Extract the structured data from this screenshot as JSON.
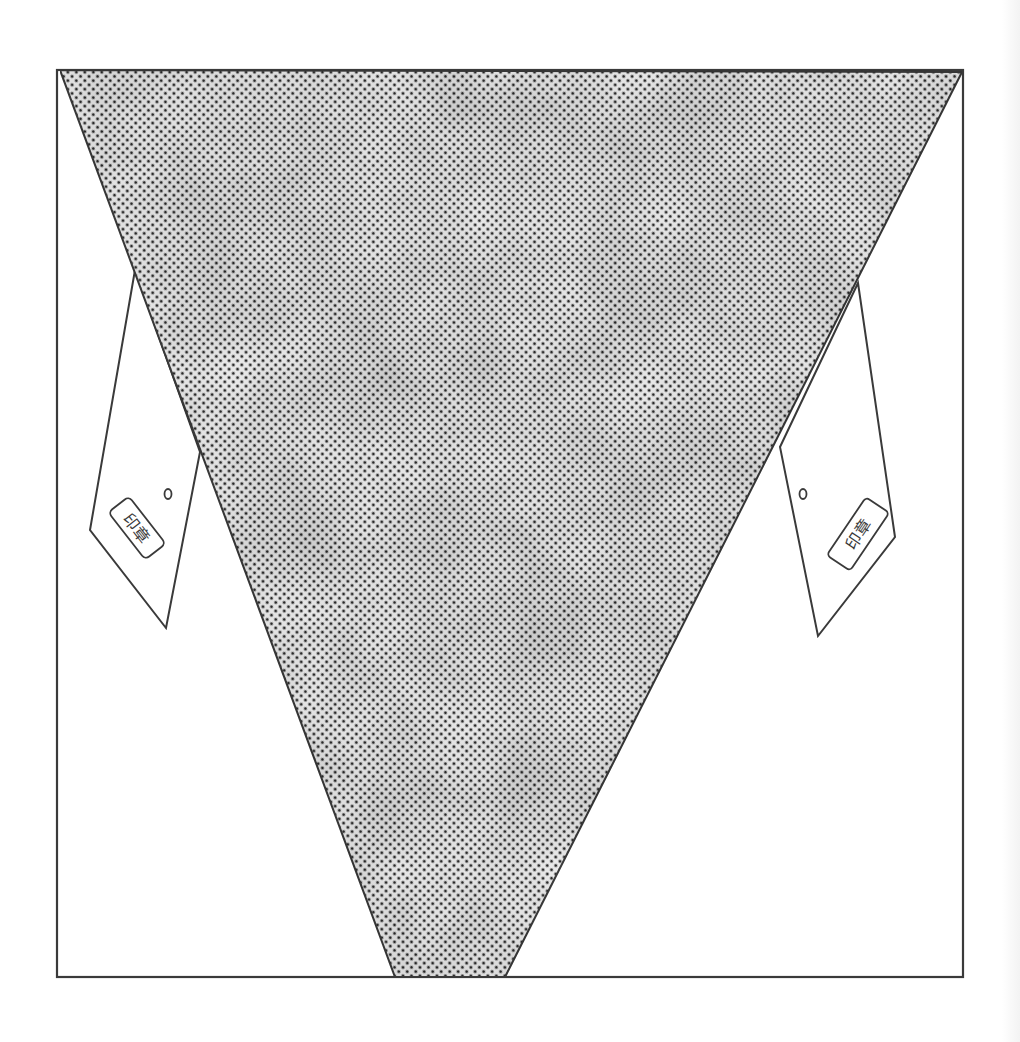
{
  "figure": {
    "colors": {
      "background": "#ffffff",
      "line": "#3a3a3a",
      "halftone_dot": "#2e2e2e",
      "halftone_light": "#e6e6e6"
    },
    "frame": {
      "x1": 57,
      "y1": 70,
      "x2": 963,
      "y2": 977
    },
    "triangle": {
      "top_left": [
        60,
        70
      ],
      "top_right": [
        962,
        72
      ],
      "bottom_left": [
        395,
        977
      ],
      "bottom_right": [
        505,
        977
      ]
    },
    "left_tag": {
      "points": [
        [
          135,
          270
        ],
        [
          200,
          452
        ],
        [
          166,
          628
        ],
        [
          90,
          530
        ]
      ],
      "hole": [
        168,
        494
      ],
      "seal": {
        "cx": 137,
        "cy": 528,
        "w": 60,
        "h": 26,
        "rotate": 52
      },
      "seal_text": "印章"
    },
    "right_tag": {
      "points": [
        [
          858,
          283
        ],
        [
          895,
          537
        ],
        [
          818,
          636
        ],
        [
          780,
          447
        ]
      ],
      "hole": [
        803,
        494
      ],
      "seal": {
        "cx": 858,
        "cy": 534,
        "w": 70,
        "h": 28,
        "rotate": -56
      },
      "seal_text": "印章"
    }
  }
}
